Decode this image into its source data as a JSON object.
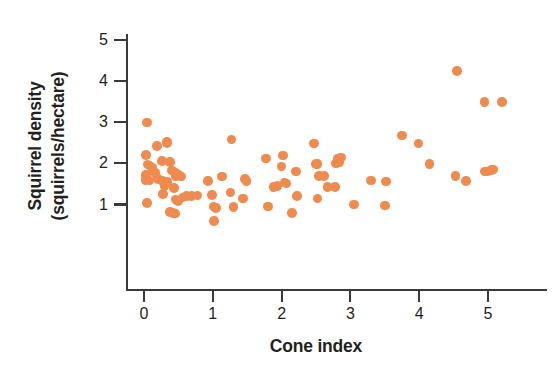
{
  "chart_data": {
    "type": "scatter",
    "title": "",
    "xlabel": "Cone index",
    "ylabel": "Squirrel density (squirrels/hectare)",
    "ylabel_line1": "Squirrel density",
    "ylabel_line2": "(squirrels/hectare)",
    "xlim": [
      -0.27,
      5.85
    ],
    "ylim": [
      0.3,
      5.35
    ],
    "xticks": [
      0,
      1,
      2,
      3,
      4,
      5
    ],
    "yticks": [
      1,
      2,
      3,
      4,
      5
    ],
    "xtick_labels": [
      "0",
      "1",
      "2",
      "3",
      "4",
      "5"
    ],
    "ytick_labels": [
      "1",
      "2",
      "3",
      "4",
      "5"
    ],
    "grid": false,
    "legend": false,
    "marker_color": "#ef8b4f",
    "axis_color": "#3b3a39",
    "text_color": "#231f20",
    "marker_size": 9.6,
    "n_points": 86,
    "points": [
      [
        0.04,
        3.0
      ],
      [
        0.19,
        2.43
      ],
      [
        0.33,
        2.5
      ],
      [
        0.33,
        2.52
      ],
      [
        0.03,
        2.2
      ],
      [
        0.05,
        1.97
      ],
      [
        0.08,
        1.95
      ],
      [
        0.26,
        2.06
      ],
      [
        0.38,
        2.03
      ],
      [
        0.14,
        1.8
      ],
      [
        0.17,
        1.76
      ],
      [
        0.41,
        1.83
      ],
      [
        0.45,
        1.78
      ],
      [
        0.03,
        1.72
      ],
      [
        0.02,
        1.6
      ],
      [
        0.08,
        1.58
      ],
      [
        0.2,
        1.62
      ],
      [
        0.27,
        1.57
      ],
      [
        0.46,
        1.7
      ],
      [
        0.5,
        1.72
      ],
      [
        0.54,
        1.68
      ],
      [
        0.3,
        1.44
      ],
      [
        0.44,
        1.4
      ],
      [
        0.28,
        1.26
      ],
      [
        0.46,
        1.12
      ],
      [
        0.49,
        1.08
      ],
      [
        0.56,
        1.17
      ],
      [
        0.62,
        1.21
      ],
      [
        0.69,
        1.21
      ],
      [
        0.78,
        1.22
      ],
      [
        0.04,
        1.04
      ],
      [
        0.38,
        0.82
      ],
      [
        0.42,
        0.79
      ],
      [
        0.46,
        0.78
      ],
      [
        0.99,
        1.23
      ],
      [
        0.93,
        1.57
      ],
      [
        1.01,
        0.95
      ],
      [
        1.05,
        0.91
      ],
      [
        1.02,
        0.6
      ],
      [
        1.13,
        1.68
      ],
      [
        1.27,
        2.58
      ],
      [
        1.26,
        1.29
      ],
      [
        1.3,
        0.94
      ],
      [
        1.47,
        1.62
      ],
      [
        1.49,
        1.57
      ],
      [
        1.44,
        1.15
      ],
      [
        1.77,
        2.12
      ],
      [
        1.8,
        0.95
      ],
      [
        1.88,
        1.42
      ],
      [
        1.94,
        1.45
      ],
      [
        2.0,
        1.92
      ],
      [
        2.02,
        2.19
      ],
      [
        2.04,
        1.54
      ],
      [
        2.07,
        1.51
      ],
      [
        2.15,
        0.79
      ],
      [
        2.21,
        1.8
      ],
      [
        2.22,
        1.21
      ],
      [
        2.47,
        2.48
      ],
      [
        2.5,
        1.98
      ],
      [
        2.52,
        1.99
      ],
      [
        2.54,
        1.69
      ],
      [
        2.52,
        1.15
      ],
      [
        2.62,
        1.7
      ],
      [
        2.67,
        1.43
      ],
      [
        2.78,
        1.43
      ],
      [
        2.79,
        2.0
      ],
      [
        2.83,
        2.02
      ],
      [
        2.82,
        2.12
      ],
      [
        2.86,
        2.14
      ],
      [
        3.05,
        1.0
      ],
      [
        3.3,
        1.58
      ],
      [
        3.5,
        0.98
      ],
      [
        3.52,
        1.56
      ],
      [
        3.75,
        2.68
      ],
      [
        3.99,
        2.48
      ],
      [
        4.15,
        1.98
      ],
      [
        4.55,
        4.25
      ],
      [
        4.53,
        1.7
      ],
      [
        4.68,
        1.57
      ],
      [
        4.95,
        3.5
      ],
      [
        5.2,
        3.5
      ],
      [
        4.96,
        1.8
      ],
      [
        4.99,
        1.8
      ],
      [
        5.05,
        1.84
      ],
      [
        5.08,
        1.85
      ],
      [
        0.12,
        1.9
      ],
      [
        0.34,
        1.55
      ]
    ]
  }
}
